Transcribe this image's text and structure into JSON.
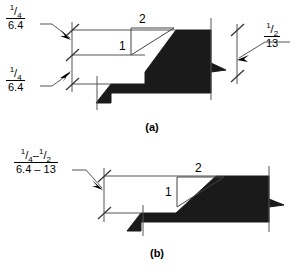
{
  "drawing": {
    "title": "Beveled edge transition detail",
    "units_note": "imperial fraction over metric millimetres",
    "ink_color": "#000000",
    "line_color": "#555555",
    "background": "#ffffff"
  },
  "figures": [
    {
      "id": "a",
      "caption": "(a)",
      "slope": {
        "rise_label": "1",
        "run_label": "2"
      },
      "callouts": [
        {
          "name": "upper-left-riser",
          "imperial_numerator": "1",
          "imperial_denominator": "4",
          "imperial_text": "1/4",
          "metric_text": "6.4"
        },
        {
          "name": "lower-left-riser",
          "imperial_numerator": "1",
          "imperial_denominator": "4",
          "imperial_text": "1/4",
          "metric_text": "6.4"
        },
        {
          "name": "right-riser",
          "imperial_numerator": "1",
          "imperial_denominator": "2",
          "imperial_text": "1/2",
          "metric_text": "13"
        }
      ]
    },
    {
      "id": "b",
      "caption": "(b)",
      "slope": {
        "rise_label": "1",
        "run_label": "2"
      },
      "callouts": [
        {
          "name": "left-riser-range",
          "imperial_from_numerator": "1",
          "imperial_from_denominator": "4",
          "imperial_to_numerator": "1",
          "imperial_to_denominator": "2",
          "imperial_text": "1/4 – 1/2",
          "range_dash": "–",
          "metric_text": "6.4 – 13"
        }
      ]
    }
  ]
}
